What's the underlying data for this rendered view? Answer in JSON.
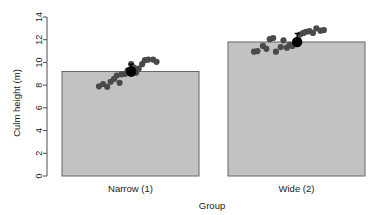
{
  "chart_data": {
    "type": "bar",
    "title": "",
    "xlabel": "Group",
    "ylabel": "Culm height (m)",
    "categories": [
      "Narrow (1)",
      "Wide (2)"
    ],
    "values": [
      9.2,
      11.8
    ],
    "ylim": [
      0,
      14
    ],
    "yticks": [
      0,
      2,
      4,
      6,
      8,
      10,
      12,
      14
    ],
    "ytick_labels": [
      "0",
      "2",
      "4",
      "6",
      "8",
      "10",
      "12",
      "14"
    ],
    "grid": false,
    "legend": "none",
    "bar_color": "#c2c2c2",
    "bar_border_color": "#666666",
    "point_color": "#4a4a4a",
    "mean_color": "#000000",
    "series": [
      {
        "name": "Narrow (1)",
        "mean": 9.2,
        "error_low": 8.75,
        "error_high": 9.85,
        "points": [
          {
            "x": 0.3,
            "y": 7.9
          },
          {
            "x": 0.36,
            "y": 8.1
          },
          {
            "x": 0.42,
            "y": 7.85
          },
          {
            "x": 0.47,
            "y": 8.3
          },
          {
            "x": 0.52,
            "y": 8.55
          },
          {
            "x": 0.56,
            "y": 8.85
          },
          {
            "x": 0.6,
            "y": 8.2
          },
          {
            "x": 0.63,
            "y": 8.95
          },
          {
            "x": 0.68,
            "y": 9.0
          },
          {
            "x": 0.72,
            "y": 9.3
          },
          {
            "x": 0.77,
            "y": 9.85
          },
          {
            "x": 0.81,
            "y": 9.55
          },
          {
            "x": 0.84,
            "y": 9.1
          },
          {
            "x": 0.88,
            "y": 9.45
          },
          {
            "x": 0.93,
            "y": 9.85
          },
          {
            "x": 0.97,
            "y": 10.2
          },
          {
            "x": 1.02,
            "y": 10.25
          },
          {
            "x": 1.09,
            "y": 10.25
          },
          {
            "x": 1.14,
            "y": 10.05
          }
        ]
      },
      {
        "name": "Wide (2)",
        "mean": 11.8,
        "error_low": 11.35,
        "error_high": 12.55,
        "points": [
          {
            "x": 0.14,
            "y": 10.95
          },
          {
            "x": 0.19,
            "y": 11.0
          },
          {
            "x": 0.27,
            "y": 11.45
          },
          {
            "x": 0.32,
            "y": 11.2
          },
          {
            "x": 0.37,
            "y": 12.05
          },
          {
            "x": 0.42,
            "y": 12.15
          },
          {
            "x": 0.46,
            "y": 10.95
          },
          {
            "x": 0.53,
            "y": 11.35
          },
          {
            "x": 0.57,
            "y": 11.95
          },
          {
            "x": 0.62,
            "y": 11.3
          },
          {
            "x": 0.66,
            "y": 11.55
          },
          {
            "x": 0.7,
            "y": 11.45
          },
          {
            "x": 0.76,
            "y": 11.9
          },
          {
            "x": 0.81,
            "y": 12.45
          },
          {
            "x": 0.86,
            "y": 12.6
          },
          {
            "x": 0.9,
            "y": 12.7
          },
          {
            "x": 0.95,
            "y": 12.75
          },
          {
            "x": 1.0,
            "y": 12.6
          },
          {
            "x": 1.05,
            "y": 13.0
          },
          {
            "x": 1.11,
            "y": 12.8
          },
          {
            "x": 1.16,
            "y": 12.85
          }
        ]
      }
    ]
  }
}
